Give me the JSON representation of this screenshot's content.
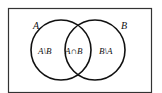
{
  "diagram": {
    "type": "venn",
    "universe_border_color": "#333333",
    "circle_stroke_color": "#111111",
    "sets": [
      {
        "name": "A",
        "label": "A"
      },
      {
        "name": "B",
        "label": "B"
      }
    ],
    "regions": {
      "a_minus_b": "A\\B",
      "a_intersect_b": "A∩B",
      "b_minus_a": "B\\A"
    }
  }
}
